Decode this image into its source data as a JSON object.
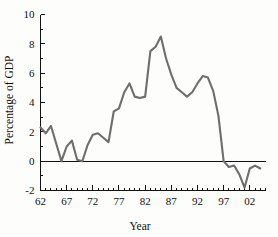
{
  "chart_data": {
    "type": "line",
    "title": "",
    "xlabel": "Year",
    "ylabel": "Percentage of GDP",
    "xlim": [
      1962,
      2005
    ],
    "ylim": [
      -2,
      10
    ],
    "grid": false,
    "legend": "none",
    "line_color": "#6e6e6e",
    "axis_color": "#111111",
    "y_ticks": [
      10,
      8,
      6,
      4,
      2,
      0,
      -2
    ],
    "y_tick_labels": [
      "10",
      "8",
      "6",
      "4",
      "2",
      "0",
      "-2"
    ],
    "y_minor_ticks": [
      9,
      7,
      5,
      3,
      1,
      -1
    ],
    "x_ticks": [
      1962,
      1967,
      1972,
      1977,
      1982,
      1987,
      1992,
      1997,
      2002
    ],
    "x_tick_labels": [
      "62",
      "67",
      "72",
      "77",
      "82",
      "87",
      "92",
      "97",
      "02"
    ],
    "x_minor_tick_step": 1,
    "zero_reference_line": 0,
    "x": [
      1962,
      1963,
      1964,
      1965,
      1966,
      1967,
      1968,
      1969,
      1970,
      1971,
      1972,
      1973,
      1974,
      1975,
      1976,
      1977,
      1978,
      1979,
      1980,
      1981,
      1982,
      1983,
      1984,
      1985,
      1986,
      1987,
      1988,
      1989,
      1990,
      1991,
      1992,
      1993,
      1994,
      1995,
      1996,
      1997,
      1998,
      1999,
      2000,
      2001,
      2002,
      2003,
      2004
    ],
    "values": [
      2.3,
      1.9,
      2.4,
      1.2,
      0.0,
      1.0,
      1.4,
      0.1,
      0.0,
      1.1,
      1.8,
      1.9,
      1.6,
      1.3,
      3.4,
      3.6,
      4.7,
      5.3,
      4.4,
      4.3,
      4.4,
      7.5,
      7.8,
      8.5,
      7.0,
      5.9,
      5.0,
      4.7,
      4.4,
      4.7,
      5.3,
      5.8,
      5.7,
      4.8,
      3.1,
      0.0,
      -0.4,
      -0.3,
      -0.9,
      -1.8,
      -0.5,
      -0.3,
      -0.5
    ],
    "annotations": []
  },
  "axis_titles": {
    "x": "Year",
    "y": "Percentage of GDP"
  }
}
